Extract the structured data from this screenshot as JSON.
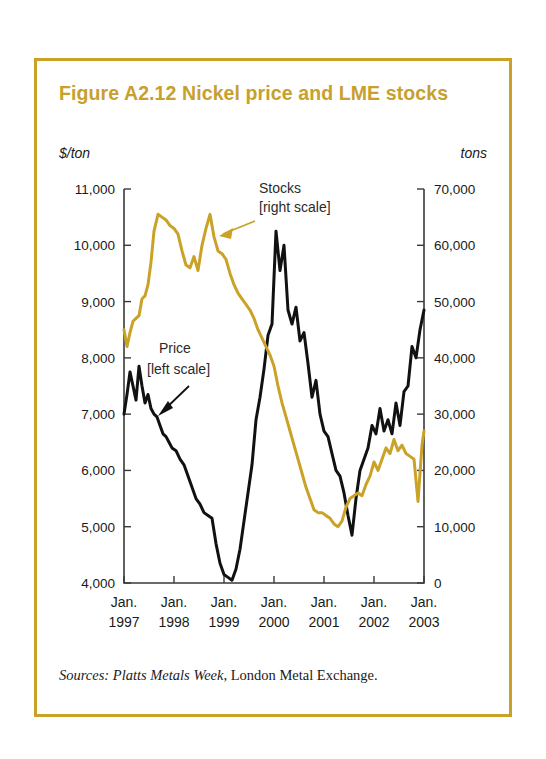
{
  "figure": {
    "title": "Figure A2.12  Nickel price and LME stocks",
    "left_unit": "$/ton",
    "right_unit": "tons",
    "source_prefix": "Sources:",
    "source_italic": "Platts Metals Week",
    "source_rest": ", London Metal Exchange."
  },
  "colors": {
    "border": "#c9a227",
    "title": "#c8a02c",
    "price_line": "#111111",
    "stocks_line": "#c9a227",
    "axis": "#3a3a3a",
    "text": "#1a1a1a",
    "background": "#ffffff"
  },
  "annotations": {
    "stocks_label_line1": "Stocks",
    "stocks_label_line2": "[right scale]",
    "price_label_line1": "Price",
    "price_label_line2": "[left scale]"
  },
  "chart_data": {
    "type": "line",
    "title": "Figure A2.12  Nickel price and LME stocks",
    "xlabel": "",
    "ylabel": "$/ton",
    "y2label": "tons",
    "grid": false,
    "legend": "inline-annotations",
    "xlim": [
      1997.0,
      2003.0
    ],
    "ylim": [
      4000,
      11000
    ],
    "y2lim": [
      0,
      70000
    ],
    "ytick_labels": [
      "11,000",
      "10,000",
      "9,000",
      "8,000",
      "7,000",
      "6,000",
      "5,000",
      "4,000"
    ],
    "ytick_values": [
      11000,
      10000,
      9000,
      8000,
      7000,
      6000,
      5000,
      4000
    ],
    "y2tick_labels": [
      "70,000",
      "60,000",
      "50,000",
      "40,000",
      "30,000",
      "20,000",
      "10,000",
      "0"
    ],
    "y2tick_values": [
      70000,
      60000,
      50000,
      40000,
      30000,
      20000,
      10000,
      0
    ],
    "xtick_labels_top": [
      "Jan.",
      "Jan.",
      "Jan.",
      "Jan.",
      "Jan.",
      "Jan.",
      "Jan."
    ],
    "xtick_labels_bottom": [
      "1997",
      "1998",
      "1999",
      "2000",
      "2001",
      "2002",
      "2003"
    ],
    "xtick_values": [
      1997,
      1998,
      1999,
      2000,
      2001,
      2002,
      2003
    ],
    "series": [
      {
        "name": "Price [left scale]",
        "axis": "left",
        "unit": "$/ton",
        "color": "#111111",
        "x": [
          1997.0,
          1997.06,
          1997.12,
          1997.18,
          1997.24,
          1997.3,
          1997.36,
          1997.42,
          1997.48,
          1997.54,
          1997.6,
          1997.66,
          1997.72,
          1997.78,
          1997.84,
          1997.9,
          1997.96,
          1998.04,
          1998.12,
          1998.2,
          1998.28,
          1998.36,
          1998.44,
          1998.52,
          1998.6,
          1998.68,
          1998.76,
          1998.84,
          1998.92,
          1999.0,
          1999.08,
          1999.16,
          1999.24,
          1999.32,
          1999.4,
          1999.48,
          1999.56,
          1999.64,
          1999.72,
          1999.8,
          1999.88,
          1999.96,
          2000.04,
          2000.12,
          2000.2,
          2000.28,
          2000.36,
          2000.44,
          2000.52,
          2000.6,
          2000.68,
          2000.76,
          2000.84,
          2000.92,
          2001.0,
          2001.08,
          2001.16,
          2001.24,
          2001.32,
          2001.4,
          2001.48,
          2001.56,
          2001.64,
          2001.72,
          2001.8,
          2001.88,
          2001.96,
          2002.04,
          2002.12,
          2002.2,
          2002.28,
          2002.36,
          2002.44,
          2002.52,
          2002.6,
          2002.68,
          2002.76,
          2002.84,
          2002.92,
          2003.0
        ],
        "y": [
          7000,
          7350,
          7750,
          7500,
          7250,
          7850,
          7500,
          7200,
          7350,
          7100,
          7000,
          6950,
          6800,
          6650,
          6600,
          6500,
          6400,
          6350,
          6200,
          6100,
          5900,
          5700,
          5500,
          5400,
          5250,
          5200,
          5150,
          4700,
          4350,
          4150,
          4100,
          4050,
          4250,
          4600,
          5100,
          5600,
          6100,
          6900,
          7300,
          7800,
          8400,
          8600,
          10250,
          9550,
          10000,
          8850,
          8600,
          8900,
          8300,
          8450,
          7900,
          7300,
          7600,
          7000,
          6700,
          6600,
          6300,
          6000,
          5900,
          5600,
          5200,
          4850,
          5500,
          6000,
          6200,
          6400,
          6800,
          6650,
          7100,
          6700,
          6900,
          6650,
          7200,
          6800,
          7400,
          7500,
          8200,
          8000,
          8500,
          8850
        ]
      },
      {
        "name": "Stocks [right scale]",
        "axis": "right",
        "unit": "tons",
        "color": "#c9a227",
        "x": [
          1997.0,
          1997.06,
          1997.12,
          1997.18,
          1997.24,
          1997.3,
          1997.36,
          1997.42,
          1997.48,
          1997.54,
          1997.6,
          1997.68,
          1997.76,
          1997.84,
          1997.92,
          1998.0,
          1998.08,
          1998.16,
          1998.24,
          1998.32,
          1998.4,
          1998.48,
          1998.56,
          1998.64,
          1998.72,
          1998.8,
          1998.88,
          1998.96,
          1999.04,
          1999.12,
          1999.2,
          1999.28,
          1999.36,
          1999.44,
          1999.52,
          1999.6,
          1999.68,
          1999.76,
          1999.84,
          1999.92,
          2000.0,
          2000.08,
          2000.16,
          2000.24,
          2000.32,
          2000.4,
          2000.48,
          2000.56,
          2000.64,
          2000.72,
          2000.8,
          2000.88,
          2000.96,
          2001.04,
          2001.12,
          2001.2,
          2001.28,
          2001.36,
          2001.44,
          2001.52,
          2001.6,
          2001.68,
          2001.76,
          2001.84,
          2001.92,
          2002.0,
          2002.08,
          2002.16,
          2002.24,
          2002.32,
          2002.4,
          2002.48,
          2002.56,
          2002.64,
          2002.72,
          2002.8,
          2002.88,
          2002.96,
          2003.0
        ],
        "y": [
          45000,
          42000,
          44500,
          46500,
          47000,
          47500,
          50500,
          51000,
          53000,
          57000,
          62500,
          65500,
          65000,
          64500,
          63500,
          63000,
          62000,
          59000,
          56500,
          56000,
          58000,
          55500,
          60000,
          63000,
          65500,
          61500,
          59000,
          58500,
          57500,
          55000,
          53000,
          51500,
          50500,
          49500,
          48500,
          47000,
          45000,
          43500,
          42000,
          40500,
          38500,
          35000,
          32000,
          29500,
          27000,
          24500,
          22000,
          19500,
          17000,
          15000,
          13000,
          12500,
          12500,
          12000,
          11500,
          10500,
          10000,
          11000,
          13500,
          15000,
          15500,
          16000,
          15500,
          17500,
          19000,
          21500,
          20000,
          22000,
          24000,
          23000,
          25500,
          23500,
          24500,
          23000,
          22500,
          22000,
          14500,
          24500,
          27000
        ]
      }
    ]
  }
}
